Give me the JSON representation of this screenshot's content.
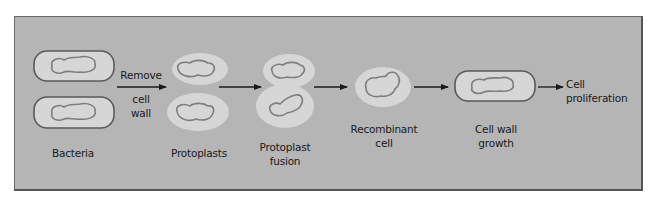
{
  "diagram": {
    "colors": {
      "background": "#b5b5b5",
      "cell_fill": "#d6d6d6",
      "cell_wall": "#5a5a5a",
      "nucleoid": "#7e7e7e",
      "arrow": "#1a1a1a",
      "text": "#1a1a1a"
    },
    "stages": [
      {
        "id": "bacteria",
        "label": "Bacteria"
      },
      {
        "id": "protoplasts",
        "label": "Protoplasts"
      },
      {
        "id": "protoplast-fusion",
        "label_line1": "Protoplast",
        "label_line2": "fusion"
      },
      {
        "id": "recombinant-cell",
        "label_line1": "Recombinant",
        "label_line2": "cell"
      },
      {
        "id": "cell-wall-growth",
        "label_line1": "Cell wall",
        "label_line2": "growth"
      }
    ],
    "steps": {
      "remove_line1": "Remove",
      "remove_line2": "cell",
      "remove_line3": "wall"
    },
    "outcome": {
      "line1": "Cell",
      "line2": "proliferation"
    }
  }
}
